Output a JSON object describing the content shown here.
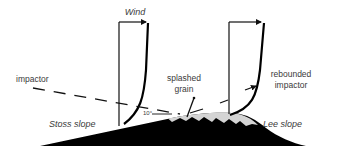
{
  "diagram": {
    "labels": {
      "wind": "Wind",
      "impactor": "impactor",
      "splashed_line1": "splashed",
      "splashed_line2": "grain",
      "rebounded_line1": "rebounded",
      "rebounded_line2": "impactor",
      "angle": "10°",
      "stoss_slope": "Stoss slope",
      "lee_slope": "Lee slope"
    },
    "colors": {
      "dune": "#000000",
      "surface_layer": "#d4d4d4",
      "lines": "#111111",
      "text": "#3a3a3a"
    },
    "elements": [
      {
        "id": "wind-profile-upwind",
        "kind": "velocity-profile"
      },
      {
        "id": "wind-profile-crest",
        "kind": "velocity-profile"
      },
      {
        "id": "impactor-trajectory",
        "kind": "dashed-arrow"
      },
      {
        "id": "splashed-grain-trajectory",
        "kind": "arrow"
      },
      {
        "id": "rebounded-impactor-trajectory",
        "kind": "dashed-arrow"
      },
      {
        "id": "dune",
        "kind": "shape"
      }
    ]
  }
}
